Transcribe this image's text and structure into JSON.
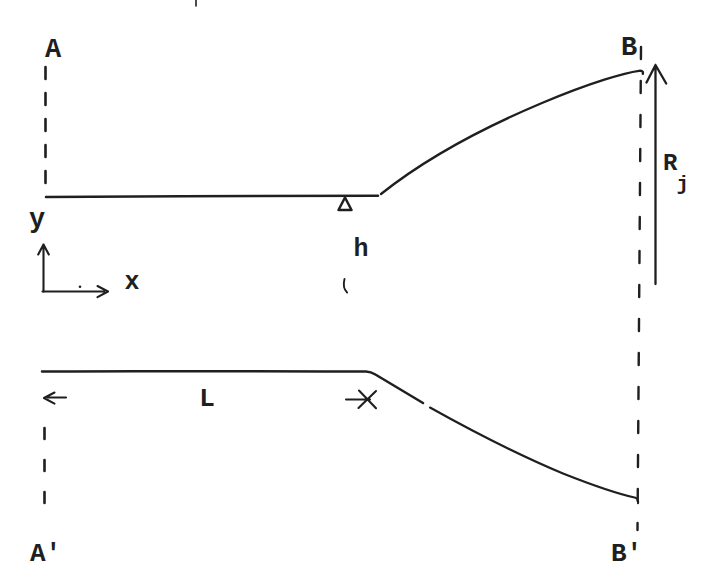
{
  "figure": {
    "colors": {
      "paper": "#ffffff",
      "ink": "#1f1f1f"
    },
    "labels": {
      "top_left": "A",
      "top_right": "B",
      "bottom_left": "A'",
      "bottom_right": "B'",
      "axis_y": "y",
      "axis_x": "x",
      "throat_half_height": "h",
      "channel_length": "L",
      "jet_radius": "R",
      "jet_radius_subscript": "j"
    }
  }
}
